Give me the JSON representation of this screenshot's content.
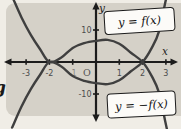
{
  "labels": {
    "f": "y = f(x)",
    "neg_f": "y = −f(x)",
    "x_axis": "x",
    "y_axis": "y",
    "origin": "O",
    "edge_glyph": "g"
  },
  "colors": {
    "panel_bg": "#d5d1c8",
    "outside_bg": "#f0ede6",
    "axis": "#1c1c1c",
    "curve": "#3f3f3f",
    "tick_label": "#4c4c4c",
    "box_bg": "#fcfbf8",
    "box_border": "#1b1b1b"
  },
  "chart_data": {
    "type": "line",
    "title": "",
    "xlabel": "x",
    "ylabel": "y",
    "xlim": [
      -3.9,
      3.6
    ],
    "ylim": [
      -20,
      19
    ],
    "grid": false,
    "legend_position": "boxed-annotations",
    "x": [
      -3.6,
      -3.2,
      -2.8,
      -2.4,
      -2,
      -1.5,
      -1,
      -0.5,
      0,
      0.5,
      1,
      1.5,
      2,
      2.4,
      2.7,
      3.0,
      3.1
    ],
    "series": [
      {
        "name": "y = f(x)",
        "values": [
          -20.5,
          -14,
          -8.5,
          -4,
          0,
          -1.3,
          -4.4,
          -5.9,
          -6.6,
          -6.9,
          -5.7,
          -2.9,
          0,
          4.5,
          9.5,
          19.5,
          23
        ],
        "features": "tangent to x-axis at x=-2 (double root), local min ~-7 near x=0.6, crosses x-axis at x=2"
      },
      {
        "name": "y = -f(x)",
        "values": [
          20.5,
          14,
          8.5,
          4,
          0,
          1.3,
          4.4,
          5.9,
          6.6,
          6.9,
          5.7,
          2.9,
          0,
          -4.5,
          -9.5,
          -19.5,
          -23
        ],
        "features": "mirror image of f(x) across the x-axis"
      }
    ],
    "x_ticks": [
      {
        "value": -3,
        "label": "-3",
        "muted": false
      },
      {
        "value": -2,
        "label": "-2",
        "muted": false
      },
      {
        "value": -1,
        "label": "-1",
        "muted": true
      },
      {
        "value": 1,
        "label": "1",
        "muted": false
      },
      {
        "value": 2,
        "label": "2",
        "muted": false
      },
      {
        "value": 3,
        "label": "3",
        "muted": false
      }
    ],
    "y_ticks": [
      {
        "value": 10,
        "label": "10"
      },
      {
        "value": -10,
        "label": "-10"
      }
    ]
  }
}
